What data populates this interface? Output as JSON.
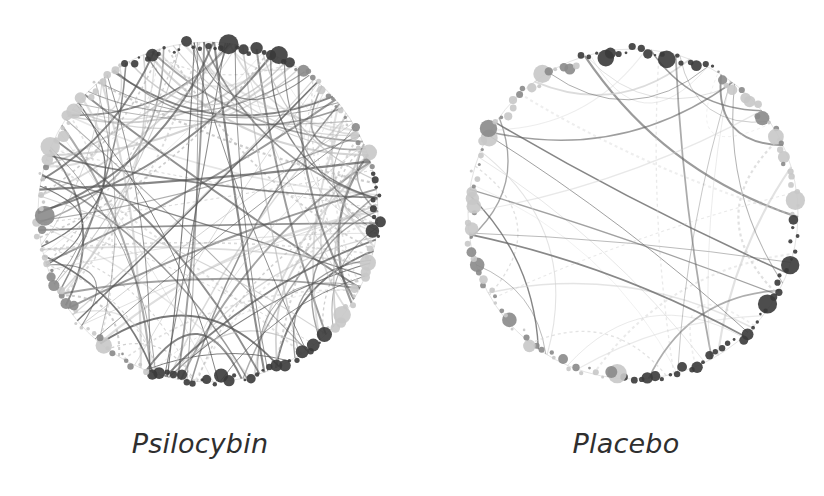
{
  "figure": {
    "background": "#ffffff",
    "panels": [
      {
        "label": "Psilocybin",
        "center": [
          208,
          212
        ],
        "radius": 170,
        "edge_density": "high",
        "edge_count": 150,
        "edge_color_dark": "#555555",
        "edge_color_light": "#bbbbbb",
        "dark_node_arcs_deg": [
          [
            -120,
            -60
          ],
          [
            -15,
            10
          ],
          [
            45,
            110
          ]
        ],
        "light_node_arcs_deg": [
          [
            -60,
            -15
          ],
          [
            110,
            200
          ]
        ],
        "node_count": 150
      },
      {
        "label": "Placebo",
        "center": [
          633,
          214
        ],
        "radius": 165,
        "edge_density": "low",
        "edge_count": 40,
        "edge_color_dark": "#666666",
        "edge_color_light": "#cfcfcf",
        "dark_node_arcs_deg": [
          [
            -110,
            -60
          ],
          [
            0,
            95
          ]
        ],
        "light_node_arcs_deg": [
          [
            -60,
            -5
          ],
          [
            95,
            250
          ]
        ],
        "node_count": 140
      }
    ],
    "node_color_dark": "#3a3a3a",
    "node_color_mid": "#8a8a8a",
    "node_color_light": "#c8c8c8"
  }
}
